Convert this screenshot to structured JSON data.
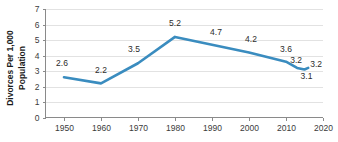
{
  "chart_data": {
    "type": "line",
    "title": "",
    "xlabel": "",
    "ylabel": "Divorces Per 1,000 Population",
    "ylabel_line1": "Divorces Per 1,000",
    "ylabel_line2": "Population",
    "xlim": [
      1945,
      2020
    ],
    "ylim": [
      0,
      7
    ],
    "grid": "horizontal",
    "legend": "none",
    "line_color": "#3a8cbf",
    "x": [
      1950,
      1960,
      1970,
      1980,
      1990,
      2000,
      2010,
      2013,
      2015,
      2016
    ],
    "values": [
      2.6,
      2.2,
      3.5,
      5.2,
      4.7,
      4.2,
      3.6,
      3.2,
      3.1,
      3.2
    ],
    "point_labels": [
      "2.6",
      "2.2",
      "3.5",
      "5.2",
      "4.7",
      "4.2",
      "3.6",
      "3.2",
      "3.1",
      "3.2"
    ],
    "xticks": [
      1950,
      1960,
      1970,
      1980,
      1990,
      2000,
      2010,
      2020
    ],
    "xtick_labels": [
      "1950",
      "1960",
      "1970",
      "1980",
      "1990",
      "2000",
      "2010",
      "2020"
    ],
    "yticks": [
      0,
      1,
      2,
      3,
      4,
      5,
      6,
      7
    ],
    "ytick_labels": [
      "0",
      "1",
      "2",
      "3",
      "4",
      "5",
      "6",
      "7"
    ]
  }
}
